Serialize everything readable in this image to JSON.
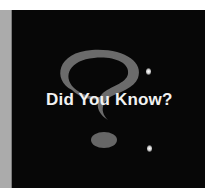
{
  "graphic": {
    "title": "Did You Know?",
    "icon": "question-mark-icon",
    "colors": {
      "background": "#ffffff",
      "panel": "#070707",
      "side_strip": "#ababab",
      "question_mark": "#6b6b6b",
      "title_text": "#f2f2f2"
    }
  }
}
